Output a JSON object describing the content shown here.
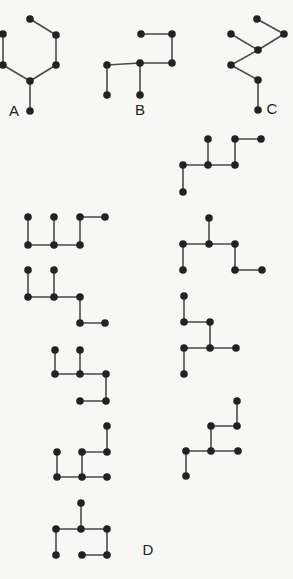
{
  "colors": {
    "background": "#f7f7f5",
    "edge": "#4a4a4a",
    "node": "#222222"
  },
  "node_radius": 3.8,
  "labels": [
    {
      "id": "A",
      "text": "A",
      "x": 14,
      "y": 110
    },
    {
      "id": "B",
      "text": "B",
      "x": 140,
      "y": 109
    },
    {
      "id": "C",
      "text": "C",
      "x": 272,
      "y": 108
    },
    {
      "id": "D",
      "text": "D",
      "x": 148,
      "y": 549
    }
  ],
  "graphs": [
    {
      "id": "A",
      "nodes": [
        [
          30,
          19
        ],
        [
          56,
          35
        ],
        [
          3,
          34
        ],
        [
          56,
          65
        ],
        [
          3,
          65
        ],
        [
          30,
          81
        ],
        [
          30,
          111
        ]
      ],
      "edges": [
        [
          0,
          1
        ],
        [
          1,
          3
        ],
        [
          3,
          5
        ],
        [
          2,
          4
        ],
        [
          4,
          5
        ],
        [
          5,
          6
        ]
      ]
    },
    {
      "id": "B",
      "nodes": [
        [
          141,
          34
        ],
        [
          172,
          34
        ],
        [
          172,
          63
        ],
        [
          140,
          63
        ],
        [
          107,
          65
        ],
        [
          107,
          95
        ],
        [
          140,
          95
        ]
      ],
      "edges": [
        [
          0,
          1
        ],
        [
          1,
          2
        ],
        [
          2,
          3
        ],
        [
          3,
          4
        ],
        [
          4,
          5
        ],
        [
          3,
          6
        ]
      ]
    },
    {
      "id": "C",
      "nodes": [
        [
          257,
          19
        ],
        [
          284,
          34
        ],
        [
          231,
          34
        ],
        [
          258,
          50
        ],
        [
          231,
          65
        ],
        [
          258,
          80
        ],
        [
          258,
          110
        ]
      ],
      "edges": [
        [
          0,
          1
        ],
        [
          1,
          3
        ],
        [
          2,
          3
        ],
        [
          3,
          4
        ],
        [
          4,
          5
        ],
        [
          5,
          6
        ]
      ]
    },
    {
      "id": "D1",
      "nodes": [
        [
          28,
          217
        ],
        [
          54,
          217
        ],
        [
          80,
          217
        ],
        [
          105,
          217
        ],
        [
          28,
          245
        ],
        [
          54,
          245
        ],
        [
          80,
          245
        ]
      ],
      "edges": [
        [
          0,
          4
        ],
        [
          1,
          5
        ],
        [
          4,
          5
        ],
        [
          5,
          6
        ],
        [
          6,
          2
        ],
        [
          2,
          3
        ]
      ]
    },
    {
      "id": "D2",
      "nodes": [
        [
          28,
          270
        ],
        [
          54,
          270
        ],
        [
          28,
          297
        ],
        [
          54,
          297
        ],
        [
          80,
          297
        ],
        [
          80,
          323
        ],
        [
          105,
          323
        ]
      ],
      "edges": [
        [
          0,
          2
        ],
        [
          1,
          3
        ],
        [
          2,
          3
        ],
        [
          3,
          4
        ],
        [
          4,
          5
        ],
        [
          5,
          6
        ]
      ]
    },
    {
      "id": "D3",
      "nodes": [
        [
          55,
          350
        ],
        [
          80,
          350
        ],
        [
          55,
          374
        ],
        [
          80,
          374
        ],
        [
          106,
          374
        ],
        [
          80,
          401
        ],
        [
          106,
          401
        ]
      ],
      "edges": [
        [
          0,
          2
        ],
        [
          1,
          3
        ],
        [
          2,
          3
        ],
        [
          3,
          4
        ],
        [
          4,
          6
        ],
        [
          5,
          6
        ]
      ]
    },
    {
      "id": "D4",
      "nodes": [
        [
          107,
          426
        ],
        [
          57,
          452
        ],
        [
          82,
          452
        ],
        [
          107,
          452
        ],
        [
          57,
          477
        ],
        [
          82,
          477
        ],
        [
          107,
          477
        ]
      ],
      "edges": [
        [
          0,
          3
        ],
        [
          2,
          3
        ],
        [
          2,
          5
        ],
        [
          1,
          4
        ],
        [
          4,
          5
        ],
        [
          5,
          6
        ]
      ]
    },
    {
      "id": "D5",
      "nodes": [
        [
          81,
          503
        ],
        [
          56,
          529
        ],
        [
          81,
          529
        ],
        [
          107,
          529
        ],
        [
          56,
          555
        ],
        [
          82,
          555
        ],
        [
          107,
          555
        ]
      ],
      "edges": [
        [
          0,
          2
        ],
        [
          1,
          2
        ],
        [
          2,
          3
        ],
        [
          1,
          4
        ],
        [
          3,
          6
        ],
        [
          5,
          6
        ]
      ]
    },
    {
      "id": "D6",
      "nodes": [
        [
          208,
          139
        ],
        [
          235,
          139
        ],
        [
          261,
          139
        ],
        [
          183,
          165
        ],
        [
          208,
          165
        ],
        [
          235,
          165
        ],
        [
          183,
          192
        ]
      ],
      "edges": [
        [
          0,
          4
        ],
        [
          1,
          2
        ],
        [
          1,
          5
        ],
        [
          3,
          4
        ],
        [
          4,
          5
        ],
        [
          3,
          6
        ]
      ]
    },
    {
      "id": "D7",
      "nodes": [
        [
          209,
          218
        ],
        [
          183,
          244
        ],
        [
          209,
          244
        ],
        [
          235,
          244
        ],
        [
          183,
          270
        ],
        [
          235,
          270
        ],
        [
          262,
          270
        ]
      ],
      "edges": [
        [
          0,
          2
        ],
        [
          1,
          2
        ],
        [
          2,
          3
        ],
        [
          1,
          4
        ],
        [
          3,
          5
        ],
        [
          5,
          6
        ]
      ]
    },
    {
      "id": "D8",
      "nodes": [
        [
          184,
          296
        ],
        [
          184,
          322
        ],
        [
          210,
          322
        ],
        [
          184,
          348
        ],
        [
          210,
          348
        ],
        [
          236,
          348
        ],
        [
          184,
          374
        ]
      ],
      "edges": [
        [
          0,
          1
        ],
        [
          1,
          2
        ],
        [
          2,
          4
        ],
        [
          3,
          4
        ],
        [
          4,
          5
        ],
        [
          3,
          6
        ]
      ]
    },
    {
      "id": "D9",
      "nodes": [
        [
          237,
          401
        ],
        [
          211,
          426
        ],
        [
          237,
          426
        ],
        [
          186,
          451
        ],
        [
          211,
          451
        ],
        [
          238,
          451
        ],
        [
          186,
          476
        ]
      ],
      "edges": [
        [
          0,
          2
        ],
        [
          1,
          2
        ],
        [
          1,
          4
        ],
        [
          3,
          4
        ],
        [
          4,
          5
        ],
        [
          3,
          6
        ]
      ]
    }
  ]
}
